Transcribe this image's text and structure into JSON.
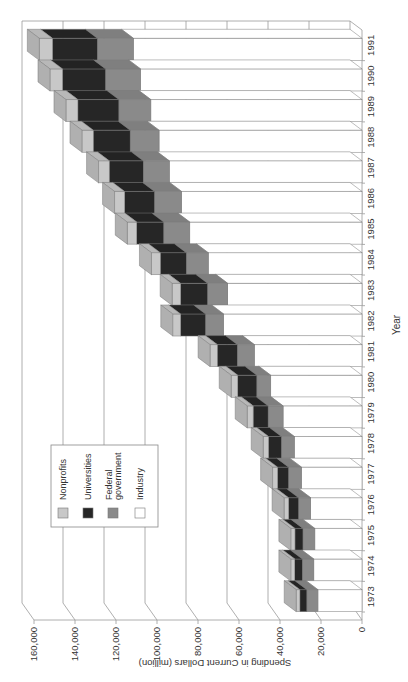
{
  "chart_data": {
    "type": "bar",
    "orientation": "rotated-90-ccw-stacked-3d",
    "title": "",
    "xlabel": "Year",
    "ylabel": "Spending in Current Dollars (million)",
    "ylim": [
      0,
      160000
    ],
    "yticks": [
      "0",
      "20,000",
      "40,000",
      "60,000",
      "80,000",
      "100,000",
      "120,000",
      "140,000",
      "160,000"
    ],
    "ytick_values": [
      0,
      20000,
      40000,
      60000,
      80000,
      100000,
      120000,
      140000,
      160000
    ],
    "grid": true,
    "legend_position": "inside-lower-left",
    "categories": [
      "1973",
      "1974",
      "1975",
      "1976",
      "1977",
      "1978",
      "1979",
      "1980",
      "1981",
      "1982",
      "1983",
      "1984",
      "1985",
      "1986",
      "1987",
      "1988",
      "1989",
      "1990",
      "1991"
    ],
    "series": [
      {
        "name": "Industry",
        "color": "#ffffff",
        "values": [
          21500,
          23500,
          23000,
          25000,
          29500,
          33000,
          38500,
          44500,
          52500,
          67500,
          65500,
          75000,
          84000,
          88000,
          94000,
          99000,
          103000,
          108000,
          111500
        ]
      },
      {
        "name": "Federal government",
        "color": "#8a8a8a",
        "values": [
          5400,
          5600,
          5800,
          5900,
          6300,
          6300,
          7300,
          6800,
          8300,
          8800,
          9800,
          10700,
          12700,
          13200,
          12700,
          14100,
          15600,
          17100,
          17600
        ]
      },
      {
        "name": "Universities",
        "color": "#262626",
        "values": [
          3400,
          3700,
          3900,
          4900,
          5400,
          6300,
          7300,
          9300,
          9800,
          12200,
          13200,
          12700,
          13200,
          14600,
          16600,
          18000,
          20000,
          21000,
          21900
        ]
      },
      {
        "name": "Nonprofits",
        "color": "#c8c8c8",
        "values": [
          1800,
          1900,
          2000,
          2200,
          2400,
          2600,
          2900,
          3200,
          3500,
          3800,
          4100,
          4300,
          4600,
          4900,
          5200,
          5500,
          5800,
          6100,
          6400
        ]
      }
    ]
  },
  "legend": {
    "items": [
      {
        "label": "Nonprofits",
        "color": "#c8c8c8"
      },
      {
        "label": "Universities",
        "color": "#262626"
      },
      {
        "label": "Federal government",
        "label_line1": "Federal",
        "label_line2": "government",
        "color": "#8a8a8a"
      },
      {
        "label": "Industry",
        "color": "#ffffff"
      }
    ]
  },
  "axes": {
    "y_label": "Spending in Current Dollars (million)",
    "x_label": "Year"
  }
}
